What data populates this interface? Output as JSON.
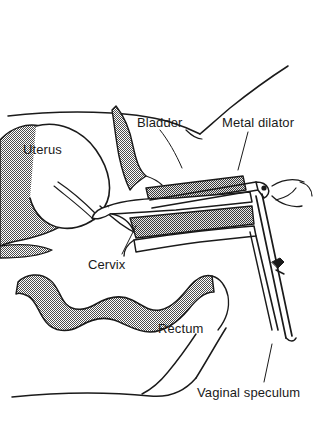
{
  "figure": {
    "ink_color": "#1a1a1a",
    "shade_color": "#8a8a8a",
    "background_color": "#ffffff",
    "width": 315,
    "height": 423
  },
  "labels": {
    "uterus": "Uterus",
    "bladder": "Bladder",
    "metal_dilator": "Metal dilator",
    "cervix": "Cervix",
    "rectum": "Rectum",
    "vaginal_speculum": "Vaginal speculum"
  },
  "structures": [
    {
      "name": "uterus",
      "label": "Uterus",
      "shaded": true
    },
    {
      "name": "bladder",
      "label": "Bladder",
      "shaded": true
    },
    {
      "name": "cervix",
      "label": "Cervix",
      "shaded": false
    },
    {
      "name": "rectum",
      "label": "Rectum",
      "shaded": true
    },
    {
      "name": "sacrum",
      "label": "",
      "shaded": true
    }
  ],
  "instruments": [
    {
      "name": "metal-dilator",
      "label": "Metal dilator"
    },
    {
      "name": "vaginal-speculum",
      "label": "Vaginal speculum"
    }
  ]
}
